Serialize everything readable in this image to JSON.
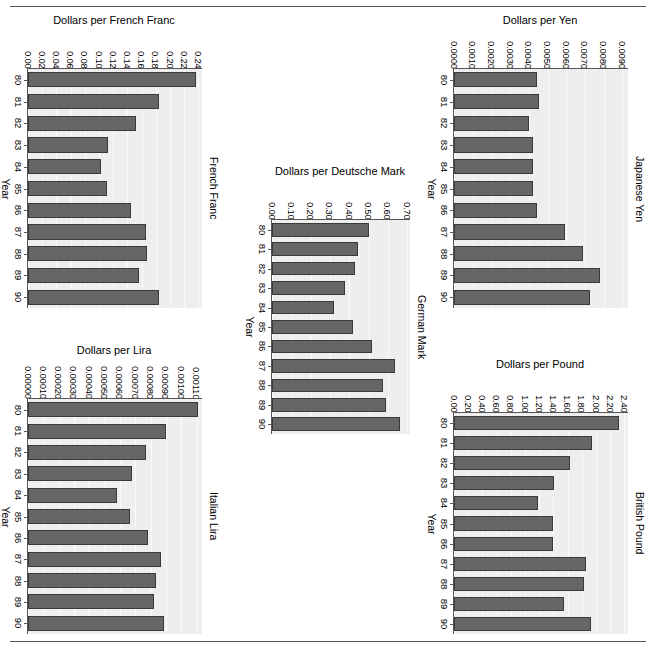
{
  "figure": {
    "kind": "trellis-bar-panels",
    "bar_color": "#666666",
    "bar_border_color": "#3a3a3a",
    "plot_bg": "#eeeeee",
    "grid_color": "#fbfbfb",
    "axis_color": "#555555",
    "rule_top": "horizontal-rule",
    "rule_bottom": "horizontal-rule"
  },
  "chart_data": [
    {
      "id": "french-franc",
      "type": "bar",
      "orientation": "horizontal",
      "title": "Dollars per French Franc",
      "strip_label": "French Franc",
      "xlabel": "Dollars per French Franc",
      "ylabel": "Year",
      "categories": [
        "80",
        "81",
        "82",
        "83",
        "84",
        "85",
        "86",
        "87",
        "88",
        "89",
        "90"
      ],
      "values": [
        0.2367,
        0.1843,
        0.1523,
        0.1131,
        0.1025,
        0.1114,
        0.1447,
        0.1665,
        0.1679,
        0.1568,
        0.1838
      ],
      "xlim": [
        0.0,
        0.245
      ],
      "xticks": [
        "0.00",
        "0.02",
        "0.04",
        "0.06",
        "0.08",
        "0.10",
        "0.12",
        "0.14",
        "0.16",
        "0.18",
        "0.20",
        "0.22",
        "0.24"
      ],
      "xtickvals": [
        0.0,
        0.02,
        0.04,
        0.06,
        0.08,
        0.1,
        0.12,
        0.14,
        0.16,
        0.18,
        0.2,
        0.22,
        0.24
      ],
      "grid": true
    },
    {
      "id": "japanese-yen",
      "type": "bar",
      "orientation": "horizontal",
      "title": "Dollars per Yen",
      "strip_label": "Japanese Yen",
      "xlabel": "Dollars per Yen",
      "ylabel": "Year",
      "categories": [
        "80",
        "81",
        "82",
        "83",
        "84",
        "85",
        "86",
        "87",
        "88",
        "89",
        "90"
      ],
      "values": [
        0.00443,
        0.00454,
        0.00402,
        0.00421,
        0.00421,
        0.0042,
        0.00443,
        0.00594,
        0.00692,
        0.0078,
        0.00725,
        0.00691
      ],
      "xlim": [
        0.0,
        0.0093
      ],
      "xticks": [
        "0.0000",
        "0.0010",
        "0.0020",
        "0.0030",
        "0.0040",
        "0.0050",
        "0.0060",
        "0.0070",
        "0.0080",
        "0.0090"
      ],
      "xtickvals": [
        0.0,
        0.001,
        0.002,
        0.003,
        0.004,
        0.005,
        0.006,
        0.007,
        0.008,
        0.009
      ],
      "grid": true
    },
    {
      "id": "german-mark",
      "type": "bar",
      "orientation": "horizontal",
      "title": "Dollars per Deutsche Mark",
      "strip_label": "German Mark",
      "xlabel": "Dollars per Deutsche Mark",
      "ylabel": "Year",
      "categories": [
        "80",
        "81",
        "82",
        "83",
        "84",
        "85",
        "86",
        "87",
        "88",
        "89",
        "90"
      ],
      "values": [
        0.503,
        0.443,
        0.432,
        0.377,
        0.323,
        0.42,
        0.516,
        0.638,
        0.574,
        0.589,
        0.663
      ],
      "xlim": [
        0.0,
        0.715
      ],
      "xticks": [
        "0.00",
        "0.10",
        "0.20",
        "0.30",
        "0.40",
        "0.50",
        "0.60",
        "0.70"
      ],
      "xtickvals": [
        0.0,
        0.1,
        0.2,
        0.3,
        0.4,
        0.5,
        0.6,
        0.7
      ],
      "grid": true
    },
    {
      "id": "italian-lira",
      "type": "bar",
      "orientation": "horizontal",
      "title": "Dollars per Lira",
      "strip_label": "Italian Lira",
      "xlabel": "Dollars per Lira",
      "ylabel": "Year",
      "categories": [
        "80",
        "81",
        "82",
        "83",
        "84",
        "85",
        "86",
        "87",
        "88",
        "89",
        "90"
      ],
      "values": [
        0.00111,
        0.0009,
        0.00077,
        0.00068,
        0.000581,
        0.000668,
        0.000781,
        0.000867,
        0.000832,
        0.00082,
        0.000887
      ],
      "xlim": [
        0.0,
        0.001135
      ],
      "xticks": [
        "0.00000",
        "0.00010",
        "0.00020",
        "0.00030",
        "0.00040",
        "0.00050",
        "0.00060",
        "0.00070",
        "0.00080",
        "0.00090",
        "0.00100",
        "0.00110"
      ],
      "xtickvals": [
        0.0,
        0.0001,
        0.0002,
        0.0003,
        0.0004,
        0.0005,
        0.0006,
        0.0007,
        0.0008,
        0.0009,
        0.001,
        0.0011
      ],
      "grid": true
    },
    {
      "id": "british-pound",
      "type": "bar",
      "orientation": "horizontal",
      "title": "Dollars per Pound",
      "strip_label": "British Pound",
      "xlabel": "Dollars per Pound",
      "ylabel": "Year",
      "categories": [
        "80",
        "81",
        "82",
        "83",
        "84",
        "85",
        "86",
        "87",
        "88",
        "89",
        "90"
      ],
      "values": [
        2.33,
        1.95,
        1.63,
        1.41,
        1.18,
        1.39,
        1.39,
        1.86,
        1.83,
        1.55,
        1.93
      ],
      "xlim": [
        0.0,
        2.45
      ],
      "xticks": [
        "0.00",
        "0.20",
        "0.40",
        "0.60",
        "0.80",
        "1.00",
        "1.20",
        "1.40",
        "1.60",
        "1.80",
        "2.00",
        "2.20",
        "2.40"
      ],
      "xtickvals": [
        0.0,
        0.2,
        0.4,
        0.6,
        0.8,
        1.0,
        1.2,
        1.4,
        1.6,
        1.8,
        2.0,
        2.2,
        2.4
      ],
      "grid": true
    }
  ],
  "panel_geometry": [
    {
      "id": "french-franc",
      "left": 6,
      "top": 14,
      "width": 216,
      "height": 300
    },
    {
      "id": "japanese-yen",
      "left": 432,
      "top": 14,
      "width": 216,
      "height": 300
    },
    {
      "id": "german-mark",
      "left": 250,
      "top": 165,
      "width": 180,
      "height": 275
    },
    {
      "id": "italian-lira",
      "left": 6,
      "top": 344,
      "width": 216,
      "height": 296
    },
    {
      "id": "british-pound",
      "left": 432,
      "top": 358,
      "width": 216,
      "height": 282
    }
  ]
}
